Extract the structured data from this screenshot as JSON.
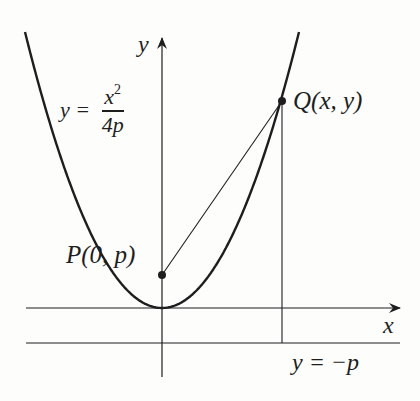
{
  "figure": {
    "type": "parabola-focus-directrix",
    "colors": {
      "ink": "#1e1e1e",
      "background": "#fdfdfc"
    },
    "axes": {
      "x_label": "x",
      "y_label": "y"
    },
    "curve": {
      "equation_lhs": "y =",
      "numerator": "x",
      "numerator_exponent": "2",
      "denominator": "4p"
    },
    "focus": {
      "label": "P(0, p)"
    },
    "point": {
      "label": "Q(x, y)"
    },
    "directrix": {
      "label": "y = −p"
    }
  }
}
